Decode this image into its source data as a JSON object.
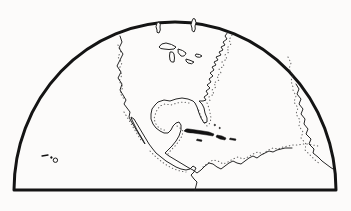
{
  "figure": {
    "type": "map-illustration",
    "depicts": [
      "North America Pacific coast with Baja California",
      "North America Atlantic coast, Florida and Gulf of Mexico",
      "Yucatan and Central America isthmus",
      "Northern coast of South America",
      "Great Lakes",
      "Hudson Bay inlets at top edge",
      "Cuba, Hispaniola, Puerto Rico, Jamaica, Bahamas",
      "Hawaiian Islands",
      "Africa/Europe coast fragment at right limb"
    ],
    "background_color": "#fcfbfa",
    "ink_color": "#141414"
  },
  "map": {
    "viewbox": "0 0 351 211",
    "paths": {
      "hemisphere": "M14,190 A161,168 0 0 1 336,190 Z",
      "pacific_coast": "M120,36 L122,42 L119,48 L123,54 L120,60 L117,66 L121,72 L118,78 L122,84 L120,90 L123,95 L126,100 L124,104 L127,108 L130,112 L129,117 L131,121 L134,126 L137,131 L140,136 L143,141 L145,144 L143,140 L140,135 L137,130 L134,124 L132,120 L131,117 L134,119 L137,124 L140,129 L143,134 L146,139 L149,144 L152,148 L156,153 L161,157 L166,161 L171,164 L176,167 L181,169 L186,170 L190,169 L193,166 L196,168 L194,172 L191,175 L194,179 L197,182 L196,186 L195,190",
      "atlantic_gulf_coast": "M228,32 L225,36 L227,39 L223,42 L225,45 L221,47 L223,50 L219,52 L221,55 L216,57 L218,60 L214,62 L216,65 L212,67 L214,70 L210,73 L213,76 L209,79 L211,82 L207,85 L210,88 L206,91 L208,94 L204,97 L206,100 L203,101 L199,101 L202,104 L204,108 L205,113 L207,118 L207,122 L204,123 L201,118 L199,113 L197,107 L195,103 L193,101 L188,99 L182,98 L176,99 L170,101 L164,100 L158,102 L155,105 L152,109 L151,114 L151,119 L153,124 L156,128 L160,131 L164,133 L168,133 L171,130 L173,126 L176,123 L179,122 L181,125 L181,130 L179,136 L176,141 L172,146 L168,150 L165,153 L169,156 L174,159 L179,162 L184,165 L189,168 L193,170 L197,173 L201,170 L205,166 L209,163 L213,164 L217,167 L221,169 L225,166 L229,163 L233,161 L237,163 L241,164 L245,161 L249,158 L253,156 L257,158 L261,155 L265,153 L269,151 L273,152 L277,150 L281,149 L285,148 L289,148 L292,148",
      "africa_edge_coast": "M296,84 L299,89 L297,94 L301,99 L299,104 L303,109 L301,114 L305,119 L304,124 L308,129 L306,134 L311,139 L309,144 L314,149 L313,153 L318,157 L322,161 L326,164 L330,167 L333,169",
      "lake_superior": "M159,47 Q161,43 166,43 Q172,44 176,47 L174,49 Q169,50 164,49 Q160,49 159,47 Z",
      "lake_michigan": "M170,52 Q169,56 170,60 Q171,63 174,62 Q175,58 174,54 Q173,51 170,52 Z",
      "lake_huron": "M178,49 Q183,50 186,53 Q185,57 181,56 Q177,53 178,49 Z",
      "lake_erie": "M186,59 Q190,60 194,62 Q192,65 188,63 Q185,61 186,59 Z",
      "lake_ontario": "M196,54 Q200,54 202,56 Q200,58 197,57 Q194,56 196,54 Z",
      "hudson_inlet_west": "M157,23 Q155,27 157,30 Q156,33 159,33 Q161,30 160,27 Q161,24 159,22 Z",
      "hudson_inlet_east": "M192,21 Q190,25 192,28 Q191,31 194,32 Q196,29 195,26 Q197,23 195,19 Q193,17 192,21 Z",
      "cuba": "M184,131 Q186,128 189,129 L196,130 L203,131 L209,132 L214,134 L213,136 L207,135 L200,134 L193,133 Q187,133 184,131 Z",
      "hispaniola": "M217,135 L222,136 L226,138 L225,140 L220,139 L216,137 Z",
      "puerto_rico": "M230,138 L236,139 L235.5,140.5 L229.5,139.5 Z",
      "jamaica": "M197,139 L202,140 L201.5,141.5 L196.5,140.5 Z",
      "bahamas": "M214,125 a0.8,0.8 0 1 0 1.6,0 a0.8,0.8 0 1 0 -1.6,0 M219,128 a0.7,0.7 0 1 0 1.4,0 a0.7,0.7 0 1 0 -1.4,0",
      "hawaii_dash": "M42,156 L48,155",
      "hawaii_islet": "M50.5,157.5 a0.9,0.9 0 1 0 1.8,0 a0.9,0.9 0 1 0 -1.8,0",
      "hawaii_atoll": "M53.2,160.2 a2.2,2.2 0 1 0 4.4,0 a2.2,2.2 0 1 0 -4.4,0",
      "stipple_atlantic": "M232,35 L229,40 L231,44 L227,48 L229,52 L225,55 L227,59 L222,62 L224,66 L219,69 L221,73 L217,76 L219,80 L214,83 L216,87 L212,90 L214,94 L209,97 L210,101 M207,103 L209,108 L210,113 L211,118 L210,123 L207,126 L203,121 L200,114 L198,108",
      "stipple_gulf": "M189,103 L183,102 L177,103 L171,105 L165,104 L160,106 L157,110 L155,115 L154,119 L156,124 L159,128 L163,130 L167,130 M177,126 L180,128 L183,131 L182,136 L179,141 L175,146 L171,150 L168,154",
      "stipple_caribbean": "M203,167 L208,163 L213,160 L218,161 L223,164 L228,162 L233,159 L238,157 L243,159 L248,157 L253,154 L258,152 L263,154 L268,150 L273,148 L278,149 L283,147 L288,146 L293,145 L298,145 L303,144 L308,144 L313,145 L318,146",
      "stipple_africa": "M288,57 L291,63 L289,69 L293,75 L291,81 L293,87 M293,90 L296,96 L294,102 L298,108 L296,114 L300,120 L299,126 L303,132 L301,138 L306,144 L305,150 L310,155 L315,160 L320,164",
      "stipple_pacific": "M118,45 L121,51 L118,57 L122,63 L119,69 L122,75 L119,81 L123,87 L120,93 L124,99 M124,112 L127,117 L130,122 L133,127 L136,132 L139,137 L142,142 M150,151 L156,157 L162,162 L168,166 L174,169 L180,171 L186,172"
    }
  }
}
